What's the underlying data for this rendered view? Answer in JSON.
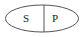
{
  "diagram": {
    "shape": "ellipse",
    "stroke_color": "#555555",
    "regions": [
      {
        "label": "S"
      },
      {
        "label": "P"
      }
    ]
  }
}
